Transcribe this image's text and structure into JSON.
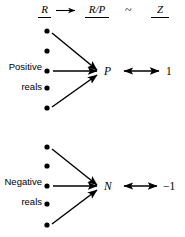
{
  "figure": {
    "background_color": "#ffffff",
    "ink_color": "#000000"
  },
  "header": {
    "source_label": "R",
    "arrow_glyph": "→",
    "quotient_label": "R/P",
    "relation_glyph": "~",
    "target_label": "Z"
  },
  "groups": [
    {
      "id": "positive",
      "label_line1": "Positive",
      "label_line2": "reals",
      "node_label": "P",
      "mapped_value": "1",
      "dot_count": 5
    },
    {
      "id": "negative",
      "label_line1": "Negative",
      "label_line2": "reals",
      "node_label": "N",
      "mapped_value": "−1",
      "dot_count": 5
    }
  ],
  "geometry": {
    "dot_radius": 2.6,
    "dot_x": 47,
    "positive_dot_ys": [
      31,
      51,
      71,
      88,
      108
    ],
    "negative_dot_ys": [
      147,
      166,
      186,
      204,
      225
    ],
    "positive_converge": [
      97,
      72
    ],
    "negative_converge": [
      97,
      187
    ]
  }
}
